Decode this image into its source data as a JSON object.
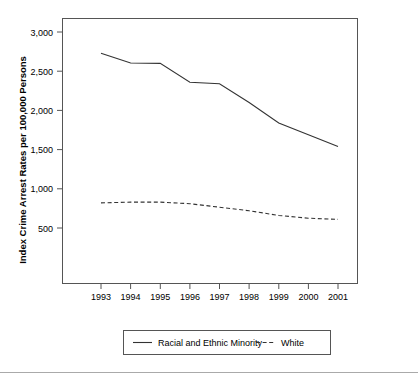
{
  "chart_data": {
    "type": "line",
    "title": "",
    "xlabel": "",
    "ylabel": "Index Crime Arrest Rates per 100,000 Persons",
    "categories": [
      "1993",
      "1994",
      "1995",
      "1996",
      "1997",
      "1998",
      "1999",
      "2000",
      "2001"
    ],
    "x": [
      1993,
      1994,
      1995,
      1996,
      1997,
      1998,
      1999,
      2000,
      2001
    ],
    "xlim": [
      1992.6,
      2001.4
    ],
    "ylim": [
      350,
      3150
    ],
    "yticks": [
      500,
      1000,
      1500,
      2000,
      2500,
      3000
    ],
    "ytick_labels": [
      "500",
      "1,000",
      "1,500",
      "2,000",
      "2,500",
      "3,000"
    ],
    "grid": false,
    "legend_position": "bottom",
    "series": [
      {
        "name": "Racial and Ethnic Minority",
        "style": "solid",
        "color": "#333333",
        "values": [
          2730,
          2605,
          2600,
          2360,
          2340,
          2100,
          1840,
          1690,
          1540
        ]
      },
      {
        "name": "White",
        "style": "dashed",
        "color": "#333333",
        "values": [
          820,
          830,
          830,
          810,
          765,
          720,
          660,
          625,
          610
        ]
      }
    ]
  },
  "legend": {
    "items": [
      {
        "label": "Racial and Ethnic Minority",
        "style": "solid"
      },
      {
        "label": "White",
        "style": "dashed"
      }
    ]
  }
}
